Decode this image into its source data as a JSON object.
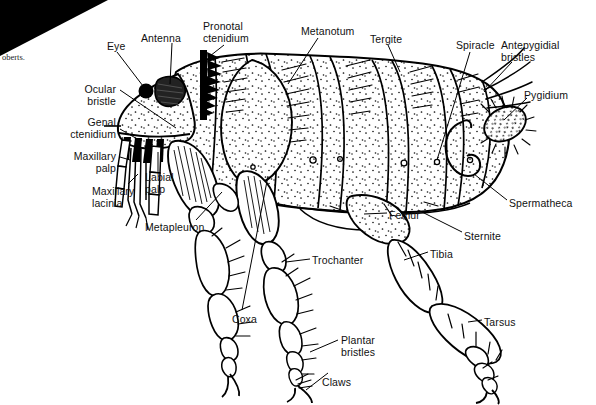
{
  "figure": {
    "style": "black ink line drawing with stippling",
    "width": 596,
    "height": 405,
    "background_color": "#ffffff",
    "ink_color": "#000000",
    "credit_text": "oberts.",
    "artifact": {
      "name": "scan-corner-artifact",
      "shape": "black triangle",
      "color": "#000000"
    }
  },
  "labels": [
    {
      "id": "eye",
      "text": "Eye",
      "x": 107,
      "y": 41,
      "align": "left"
    },
    {
      "id": "antenna",
      "text": "Antenna",
      "x": 141,
      "y": 33,
      "align": "left"
    },
    {
      "id": "pronotal-ctenidium",
      "text": "Pronotal\nctenidium",
      "x": 203,
      "y": 21,
      "align": "left"
    },
    {
      "id": "metanotum",
      "text": "Metanotum",
      "x": 301,
      "y": 26,
      "align": "left"
    },
    {
      "id": "tergite",
      "text": "Tergite",
      "x": 370,
      "y": 34,
      "align": "left"
    },
    {
      "id": "spiracle",
      "text": "Spiracle",
      "x": 456,
      "y": 40,
      "align": "left"
    },
    {
      "id": "antepygidial-bristles",
      "text": "Antepygidial\nbristles",
      "x": 501,
      "y": 40,
      "align": "left"
    },
    {
      "id": "pygidium",
      "text": "Pygidium",
      "x": 524,
      "y": 90,
      "align": "left"
    },
    {
      "id": "ocular-bristle",
      "text": "Ocular\nbristle",
      "x": 116,
      "y": 84,
      "align": "right"
    },
    {
      "id": "genal-ctenidium",
      "text": "Genal\nctenidium",
      "x": 116,
      "y": 117,
      "align": "right"
    },
    {
      "id": "maxillary-palp",
      "text": "Maxillary\npalp",
      "x": 116,
      "y": 151,
      "align": "right"
    },
    {
      "id": "labial-palp",
      "text": "Labial\npalp",
      "x": 145,
      "y": 172,
      "align": "left"
    },
    {
      "id": "maxillary-lacinia",
      "text": "Maxillary\nlacinia",
      "x": 92,
      "y": 186,
      "align": "left"
    },
    {
      "id": "metapleuron",
      "text": "Metapleuron",
      "x": 145,
      "y": 222,
      "align": "left"
    },
    {
      "id": "trochanter",
      "text": "Trochanter",
      "x": 312,
      "y": 255,
      "align": "left"
    },
    {
      "id": "coxa",
      "text": "Coxa",
      "x": 232,
      "y": 314,
      "align": "left"
    },
    {
      "id": "plantar-bristles",
      "text": "Plantar\nbristles",
      "x": 341,
      "y": 335,
      "align": "left"
    },
    {
      "id": "claws",
      "text": "Claws",
      "x": 322,
      "y": 377,
      "align": "left"
    },
    {
      "id": "femur",
      "text": "Femur",
      "x": 389,
      "y": 210,
      "align": "left"
    },
    {
      "id": "sternite",
      "text": "Sternite",
      "x": 464,
      "y": 231,
      "align": "left"
    },
    {
      "id": "tibia",
      "text": "Tibia",
      "x": 430,
      "y": 249,
      "align": "left"
    },
    {
      "id": "tarsus",
      "text": "Tarsus",
      "x": 484,
      "y": 317,
      "align": "left"
    },
    {
      "id": "spermatheca",
      "text": "Spermatheca",
      "x": 509,
      "y": 198,
      "align": "left"
    }
  ]
}
